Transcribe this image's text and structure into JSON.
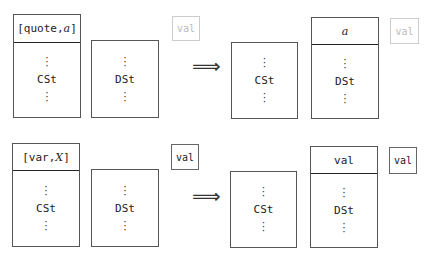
{
  "rows": [
    {
      "before": {
        "control_stack": {
          "header_prefix": "[quote,",
          "header_var": "a",
          "header_suffix": "]",
          "label": "CSt"
        },
        "data_stack": {
          "label": "DSt"
        },
        "val_box": {
          "label": "val",
          "faded": true
        }
      },
      "arrow": "⟹",
      "after": {
        "control_stack": {
          "label": "CSt"
        },
        "data_stack": {
          "header_var": "a",
          "label": "DSt"
        },
        "val_box": {
          "label": "val",
          "faded": true
        }
      }
    },
    {
      "before": {
        "control_stack": {
          "header_prefix": "[var,",
          "header_var": "X",
          "header_suffix": "]",
          "label": "CSt"
        },
        "data_stack": {
          "label": "DSt"
        },
        "val_box": {
          "label": "val",
          "faded": false
        }
      },
      "arrow": "⟹",
      "after": {
        "control_stack": {
          "label": "CSt"
        },
        "data_stack": {
          "header_text": "val",
          "label": "DSt"
        },
        "val_box": {
          "label": "val",
          "faded": false
        }
      }
    }
  ],
  "dots": "·\n·\n·"
}
